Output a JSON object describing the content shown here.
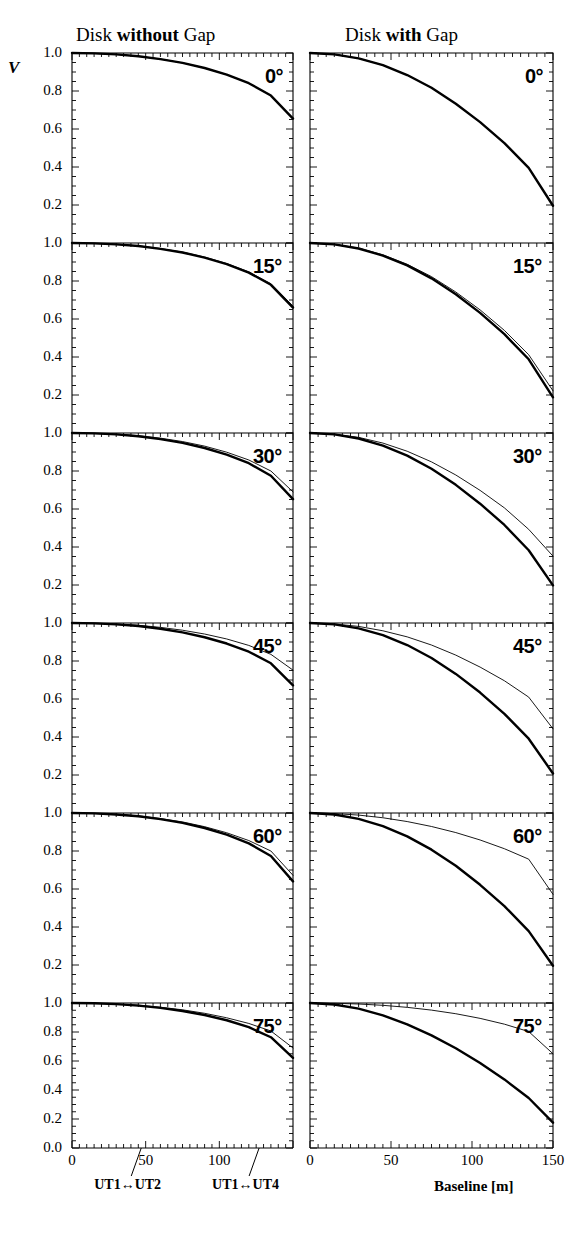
{
  "figure": {
    "columns": [
      {
        "id": "left",
        "title_prefix": "Disk ",
        "title_emph": "without",
        "title_suffix": " Gap"
      },
      {
        "id": "right",
        "title_prefix": "Disk ",
        "title_emph": "with",
        "title_suffix": " Gap"
      }
    ],
    "y_axis_label": "V",
    "x_axis_label": "Baseline [m]",
    "y_ticks": [
      "1.0",
      "0.8",
      "0.6",
      "0.4",
      "0.2"
    ],
    "y_tick_bottom": "0.0",
    "x_ticks_left": [
      "0",
      "50",
      "100",
      "150"
    ],
    "x_ticks_right": [
      "0",
      "50",
      "100",
      "150"
    ],
    "annotations": [
      {
        "label": "UT1↔UT2",
        "baseline": 47
      },
      {
        "label": "UT1↔UT4",
        "baseline": 127
      }
    ],
    "panel_labels": [
      "0°",
      "15°",
      "30°",
      "45°",
      "60°",
      "75°"
    ]
  },
  "chart_data": {
    "type": "line",
    "xlabel": "Baseline [m]",
    "ylabel": "V",
    "xlim": [
      0,
      150
    ],
    "ylim": [
      0.0,
      1.05
    ],
    "grid": false,
    "legend": "none",
    "x": [
      0,
      15,
      30,
      45,
      60,
      75,
      90,
      105,
      120,
      135,
      150
    ],
    "panels": [
      {
        "row": 0,
        "inclination": "0°",
        "column": "left",
        "model": "Disk without Gap",
        "series": [
          {
            "name": "thick",
            "style": "thick-solid",
            "values": [
              1.0,
              0.998,
              0.993,
              0.983,
              0.968,
              0.948,
              0.921,
              0.886,
              0.841,
              0.776,
              0.655
            ]
          },
          {
            "name": "thin",
            "style": "thin-solid",
            "values": [
              1.0,
              0.998,
              0.993,
              0.983,
              0.968,
              0.948,
              0.921,
              0.886,
              0.841,
              0.776,
              0.655
            ]
          }
        ]
      },
      {
        "row": 0,
        "inclination": "0°",
        "column": "right",
        "model": "Disk with Gap",
        "series": [
          {
            "name": "thick",
            "style": "thick-solid",
            "values": [
              1.0,
              0.993,
              0.972,
              0.936,
              0.884,
              0.817,
              0.733,
              0.636,
              0.526,
              0.395,
              0.196
            ]
          },
          {
            "name": "thin",
            "style": "thin-solid",
            "values": [
              1.0,
              0.993,
              0.972,
              0.936,
              0.884,
              0.817,
              0.733,
              0.636,
              0.526,
              0.395,
              0.196
            ]
          }
        ]
      },
      {
        "row": 1,
        "inclination": "15°",
        "column": "left",
        "series": [
          {
            "name": "thick",
            "style": "thick-solid",
            "values": [
              1.0,
              0.998,
              0.993,
              0.984,
              0.969,
              0.95,
              0.923,
              0.889,
              0.844,
              0.78,
              0.66
            ]
          },
          {
            "name": "thin",
            "style": "thin-solid",
            "values": [
              1.0,
              0.998,
              0.994,
              0.985,
              0.971,
              0.952,
              0.926,
              0.892,
              0.848,
              0.786,
              0.668
            ]
          }
        ]
      },
      {
        "row": 1,
        "inclination": "15°",
        "column": "right",
        "series": [
          {
            "name": "thick",
            "style": "thick-solid",
            "values": [
              1.0,
              0.993,
              0.971,
              0.934,
              0.882,
              0.814,
              0.73,
              0.632,
              0.52,
              0.388,
              0.188
            ]
          },
          {
            "name": "thin",
            "style": "thin-solid",
            "values": [
              1.0,
              0.993,
              0.973,
              0.938,
              0.888,
              0.823,
              0.742,
              0.648,
              0.54,
              0.412,
              0.222
            ]
          }
        ]
      },
      {
        "row": 2,
        "inclination": "30°",
        "column": "left",
        "series": [
          {
            "name": "thick",
            "style": "thick-solid",
            "values": [
              1.0,
              0.998,
              0.993,
              0.983,
              0.968,
              0.948,
              0.921,
              0.886,
              0.841,
              0.775,
              0.652
            ]
          },
          {
            "name": "thin",
            "style": "thin-solid",
            "values": [
              1.0,
              0.998,
              0.994,
              0.986,
              0.973,
              0.955,
              0.931,
              0.899,
              0.858,
              0.8,
              0.69
            ]
          }
        ]
      },
      {
        "row": 2,
        "inclination": "30°",
        "column": "right",
        "series": [
          {
            "name": "thick",
            "style": "thick-solid",
            "values": [
              1.0,
              0.993,
              0.971,
              0.934,
              0.881,
              0.812,
              0.727,
              0.628,
              0.516,
              0.383,
              0.198
            ]
          },
          {
            "name": "thin",
            "style": "thin-solid",
            "values": [
              1.0,
              0.994,
              0.977,
              0.947,
              0.904,
              0.848,
              0.779,
              0.698,
              0.606,
              0.493,
              0.352
            ]
          }
        ]
      },
      {
        "row": 3,
        "inclination": "45°",
        "column": "left",
        "series": [
          {
            "name": "thick",
            "style": "thick-solid",
            "values": [
              1.0,
              0.998,
              0.993,
              0.984,
              0.97,
              0.951,
              0.925,
              0.892,
              0.849,
              0.788,
              0.672
            ]
          },
          {
            "name": "thin",
            "style": "thin-solid",
            "values": [
              1.0,
              0.999,
              0.995,
              0.988,
              0.977,
              0.962,
              0.942,
              0.916,
              0.882,
              0.835,
              0.752
            ]
          }
        ]
      },
      {
        "row": 3,
        "inclination": "45°",
        "column": "right",
        "series": [
          {
            "name": "thick",
            "style": "thick-solid",
            "values": [
              1.0,
              0.993,
              0.972,
              0.936,
              0.884,
              0.816,
              0.732,
              0.634,
              0.522,
              0.391,
              0.208
            ]
          },
          {
            "name": "thin",
            "style": "thin-solid",
            "values": [
              1.0,
              0.995,
              0.982,
              0.959,
              0.927,
              0.884,
              0.831,
              0.768,
              0.696,
              0.61,
              0.443
            ]
          }
        ]
      },
      {
        "row": 4,
        "inclination": "60°",
        "column": "left",
        "series": [
          {
            "name": "thick",
            "style": "thick-solid",
            "values": [
              1.0,
              0.998,
              0.992,
              0.983,
              0.968,
              0.948,
              0.921,
              0.886,
              0.84,
              0.774,
              0.64
            ]
          },
          {
            "name": "thin",
            "style": "thin-solid",
            "values": [
              1.0,
              0.998,
              0.993,
              0.985,
              0.971,
              0.953,
              0.928,
              0.896,
              0.855,
              0.8,
              0.672
            ]
          }
        ]
      },
      {
        "row": 4,
        "inclination": "60°",
        "column": "right",
        "series": [
          {
            "name": "thick",
            "style": "thick-solid",
            "values": [
              1.0,
              0.992,
              0.969,
              0.931,
              0.877,
              0.807,
              0.722,
              0.622,
              0.51,
              0.378,
              0.196
            ]
          },
          {
            "name": "thin",
            "style": "thin-solid",
            "values": [
              1.0,
              0.997,
              0.989,
              0.975,
              0.955,
              0.929,
              0.897,
              0.858,
              0.812,
              0.757,
              0.572
            ]
          }
        ]
      },
      {
        "row": 5,
        "inclination": "75°",
        "column": "left",
        "series": [
          {
            "name": "thick",
            "style": "thick-solid",
            "values": [
              1.0,
              0.998,
              0.992,
              0.982,
              0.966,
              0.945,
              0.917,
              0.881,
              0.833,
              0.764,
              0.622
            ]
          },
          {
            "name": "thin",
            "style": "thin-solid",
            "values": [
              1.0,
              0.998,
              0.993,
              0.985,
              0.971,
              0.953,
              0.929,
              0.898,
              0.859,
              0.807,
              0.69
            ]
          }
        ]
      },
      {
        "row": 5,
        "inclination": "75°",
        "column": "right",
        "series": [
          {
            "name": "thick",
            "style": "thick-solid",
            "values": [
              1.0,
              0.99,
              0.961,
              0.915,
              0.853,
              0.777,
              0.688,
              0.586,
              0.473,
              0.345,
              0.175
            ]
          },
          {
            "name": "thin",
            "style": "thin-solid",
            "values": [
              1.0,
              0.998,
              0.993,
              0.984,
              0.97,
              0.951,
              0.926,
              0.894,
              0.854,
              0.803,
              0.65
            ]
          }
        ]
      }
    ]
  }
}
